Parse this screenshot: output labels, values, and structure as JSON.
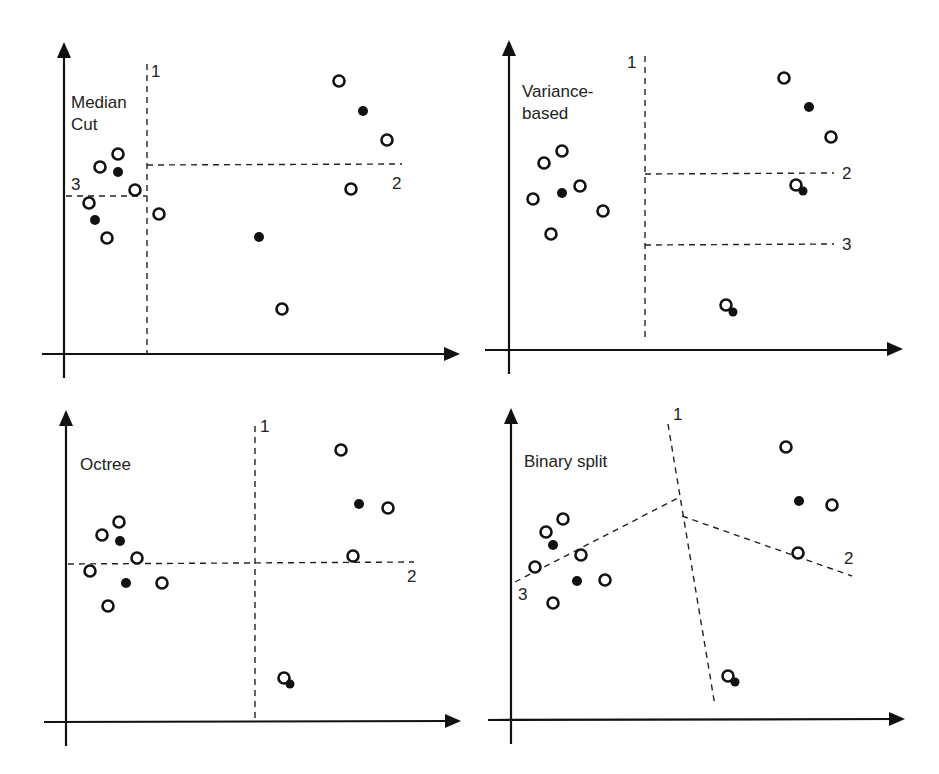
{
  "figure": {
    "panels": [
      {
        "id": "median-cut",
        "title_lines": [
          "Median",
          "Cut"
        ],
        "cut_labels": [
          "1",
          "2",
          "3"
        ]
      },
      {
        "id": "variance-based",
        "title_lines": [
          "Variance-",
          "based"
        ],
        "cut_labels": [
          "1",
          "2",
          "3"
        ]
      },
      {
        "id": "octree",
        "title_lines": [
          "Octree"
        ],
        "cut_labels": [
          "1",
          "2"
        ]
      },
      {
        "id": "binary-split",
        "title_lines": [
          "Binary split"
        ],
        "cut_labels": [
          "1",
          "2",
          "3"
        ]
      }
    ],
    "legend": {
      "open_circle": "data color",
      "filled_circle": "representative color"
    }
  }
}
